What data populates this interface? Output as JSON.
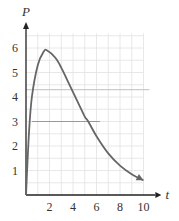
{
  "chart_data": {
    "type": "line",
    "title": "",
    "xlabel": "t",
    "ylabel": "P",
    "xlim": [
      0,
      10.5
    ],
    "ylim": [
      0,
      6.6
    ],
    "grid": true,
    "grid_step": {
      "x": 1,
      "y": 0.5
    },
    "x_ticks": [
      2,
      4,
      6,
      8,
      10
    ],
    "x_tick_labels": [
      "2",
      "4",
      "6",
      "8",
      "10"
    ],
    "y_ticks": [
      1,
      2,
      3,
      4,
      5,
      6
    ],
    "y_tick_labels": [
      "1",
      "2",
      "3",
      "4",
      "5",
      "6"
    ],
    "series": [
      {
        "name": "P(t)",
        "color": "#666666",
        "end_arrow": true,
        "x": [
          0,
          0.25,
          0.5,
          1,
          1.5,
          1.8,
          2.5,
          3,
          3.5,
          4,
          4.5,
          5,
          5.3,
          6,
          7,
          8,
          9,
          10
        ],
        "y": [
          0,
          2.5,
          4.0,
          5.3,
          5.85,
          5.9,
          5.6,
          5.2,
          4.7,
          4.2,
          3.7,
          3.2,
          3.0,
          2.4,
          1.7,
          1.2,
          0.85,
          0.6
        ]
      }
    ],
    "annotations": [
      {
        "type": "hline",
        "y": 4.3,
        "x_from": 0,
        "x_to": 10.5,
        "color": "#cccccc"
      },
      {
        "type": "hline",
        "y": 3.0,
        "x_from": 0.5,
        "x_to": 6.3,
        "color": "#999999"
      }
    ]
  }
}
